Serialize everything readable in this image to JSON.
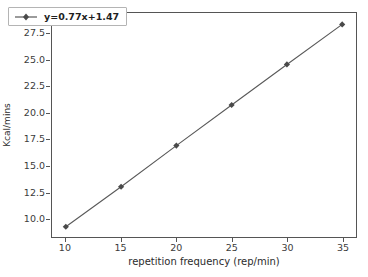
{
  "chart_data": {
    "type": "line",
    "title": "",
    "xlabel": "repetition frequency (rep/min)",
    "ylabel": "Kcal/mins",
    "x": [
      10,
      15,
      20,
      25,
      30,
      35
    ],
    "values": [
      9.2,
      13.0,
      16.9,
      20.75,
      24.6,
      28.4
    ],
    "series": [
      {
        "name": "y=0.77x+1.47",
        "values": [
          9.2,
          13.0,
          16.9,
          20.75,
          24.6,
          28.4
        ]
      }
    ],
    "xticks": [
      "10",
      "15",
      "20",
      "25",
      "30",
      "35"
    ],
    "xtick_values": [
      10,
      15,
      20,
      25,
      30,
      35
    ],
    "yticks": [
      "10.0",
      "12.5",
      "15.0",
      "17.5",
      "20.0",
      "22.5",
      "25.0",
      "27.5"
    ],
    "ytick_values": [
      10.0,
      12.5,
      15.0,
      17.5,
      20.0,
      22.5,
      25.0,
      27.5
    ],
    "xlim": [
      8.75,
      36.25
    ],
    "ylim": [
      8.23,
      29.48
    ],
    "grid": false,
    "legend": {
      "entries": [
        "y=0.77x+1.47"
      ],
      "position": "upper left"
    },
    "marker": "diamond",
    "colors": {
      "line": "#595959",
      "marker": "#4a4a4a",
      "axis": "#555555",
      "text": "#2b2b2b",
      "background": "#ffffff",
      "legend_border": "#b4b4b4"
    }
  }
}
